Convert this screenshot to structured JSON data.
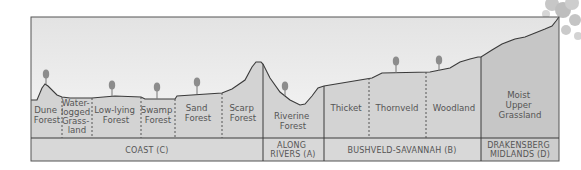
{
  "colors": {
    "sky_top": "#e6e6e6",
    "sky_bottom": "#f4f4f4",
    "ground": "#d3d3d3",
    "ground_drakensberg": "#c4c4c4",
    "band": "#d9d9d9",
    "line": "#3a3a3a",
    "tree": "#8c8c8c"
  },
  "regions": [
    {
      "name": "COAST (C)",
      "habitats": [
        {
          "lines": [
            "Dune",
            "Forest"
          ]
        },
        {
          "lines": [
            "Water-",
            "logged",
            "Grass-",
            "land"
          ]
        },
        {
          "lines": [
            "Low-lying",
            "Forest"
          ]
        },
        {
          "lines": [
            "Swamp",
            "Forest"
          ]
        },
        {
          "lines": [
            "Sand",
            "Forest"
          ]
        },
        {
          "lines": [
            "Scarp",
            "Forest"
          ]
        }
      ]
    },
    {
      "name_lines": [
        "ALONG",
        "RIVERS (A)"
      ],
      "habitats": [
        {
          "lines": [
            "Riverine",
            "Forest"
          ]
        }
      ]
    },
    {
      "name": "BUSHVELD-SAVANNAH (B)",
      "habitats": [
        {
          "lines": [
            "Thicket"
          ]
        },
        {
          "lines": [
            "Thornveld"
          ]
        },
        {
          "lines": [
            "Woodland"
          ]
        }
      ]
    },
    {
      "name_lines": [
        "DRAKENSBERG",
        "MIDLANDS (D)"
      ],
      "habitats": [
        {
          "lines": [
            "Moist",
            "Upper",
            "Grassland"
          ]
        }
      ]
    }
  ]
}
